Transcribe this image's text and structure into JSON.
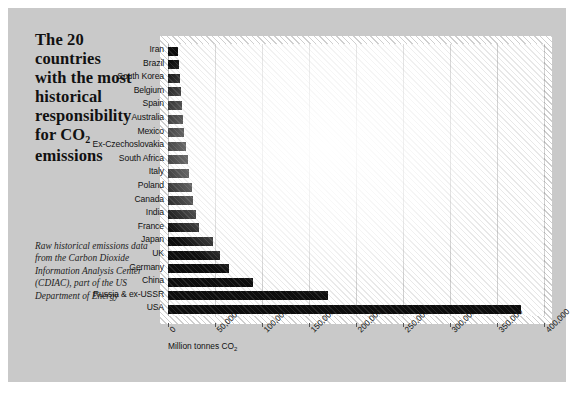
{
  "title_lines": [
    "The 20",
    "countries",
    "with the most",
    "historical",
    "responsibility",
    "for CO",
    "emissions"
  ],
  "title_subscript": "2",
  "caption": "Raw historical emissions data from the Carbon Dioxide Information Analysis Center (CDIAC), part of the US Department of Energy",
  "colors": {
    "card_background": "#c9c9c9",
    "plot_background": "#ffffff",
    "bar": "#0d0d0d",
    "gridline": "#8c8c8c",
    "text": "#111111"
  },
  "chart_data": {
    "type": "bar",
    "orientation": "horizontal",
    "xlabel": "Million tonnes CO2",
    "ylabel": "",
    "xlim": [
      0,
      400000
    ],
    "xticks": [
      0,
      50000,
      100000,
      150000,
      200000,
      250000,
      300000,
      350000,
      400000
    ],
    "xticklabels": [
      "0",
      "50,000",
      "100,000",
      "150,000",
      "200,000",
      "250,000",
      "300,000",
      "350,000",
      "400,000"
    ],
    "grid": true,
    "legend": false,
    "categories": [
      "Iran",
      "Brazil",
      "South Korea",
      "Belgium",
      "Spain",
      "Australia",
      "Mexico",
      "Ex-Czechoslovakia",
      "South Africa",
      "Italy",
      "Poland",
      "Canada",
      "India",
      "France",
      "Japan",
      "UK",
      "Germany",
      "China",
      "Russia & ex-USSR",
      "USA"
    ],
    "values": [
      11000,
      12000,
      13000,
      14000,
      15000,
      16000,
      17000,
      19000,
      21000,
      22000,
      25000,
      27000,
      30000,
      33000,
      48000,
      55000,
      65000,
      90000,
      170000,
      375000
    ],
    "units": "Million tonnes CO2"
  }
}
